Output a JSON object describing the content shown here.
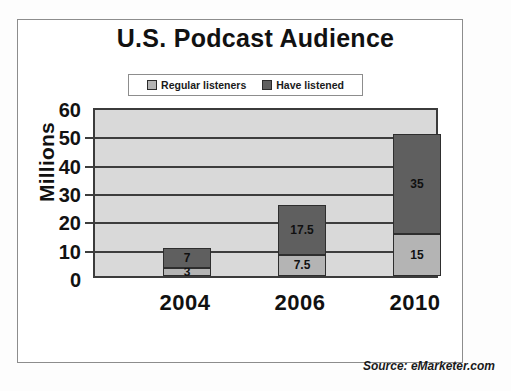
{
  "chart_data": {
    "type": "bar",
    "subtype": "stacked-vertical-bar",
    "title": "U.S. Podcast Audience",
    "xlabel": "",
    "ylabel": "Millions",
    "categories": [
      "2004",
      "2006",
      "2010"
    ],
    "series": [
      {
        "name": "Regular listeners",
        "values": [
          3,
          7.5,
          15
        ],
        "color": "#b4b4b4"
      },
      {
        "name": "Have listened",
        "values": [
          7,
          17.5,
          35
        ],
        "color": "#5f5f5f"
      }
    ],
    "stack_totals": [
      10,
      25,
      50
    ],
    "data_labels": {
      "2004": {
        "Regular listeners": "3",
        "Have listened": "7"
      },
      "2006": {
        "Regular listeners": "7.5",
        "Have listened": "17.5"
      },
      "2010": {
        "Regular listeners": "15",
        "Have listened": "35"
      }
    },
    "ylim": [
      0,
      60
    ],
    "ytick_labels": [
      "60",
      "50",
      "40",
      "30",
      "20",
      "10",
      "0"
    ],
    "ytick_values": [
      60,
      50,
      40,
      30,
      20,
      10,
      0
    ],
    "grid": true,
    "grid_axis": "y",
    "legend_position": "top-center",
    "plot_background": "#d9d9d9",
    "source": "Source: eMarketer.com"
  },
  "legend": {
    "entries": [
      {
        "label": "Regular listeners",
        "swatch": "light"
      },
      {
        "label": "Have listened",
        "swatch": "dark"
      }
    ]
  },
  "footer": {
    "source": "Source: eMarketer.com"
  }
}
